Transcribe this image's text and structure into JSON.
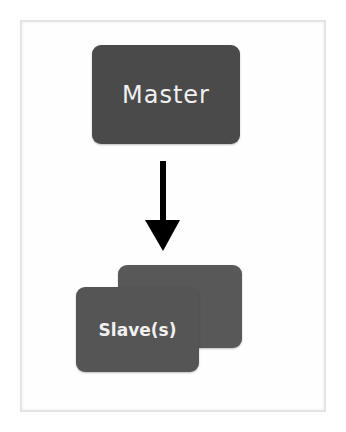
{
  "diagram": {
    "nodes": [
      {
        "id": "master",
        "label": "Master"
      },
      {
        "id": "slaves",
        "label": "Slave(s)",
        "stacked": true
      }
    ],
    "edges": [
      {
        "from": "master",
        "to": "slaves",
        "style": "arrow-down"
      }
    ],
    "colors": {
      "box": "#4f4f4f",
      "text": "#f0f0f0",
      "arrow": "#000000",
      "frame": "#e4e4e4"
    }
  }
}
